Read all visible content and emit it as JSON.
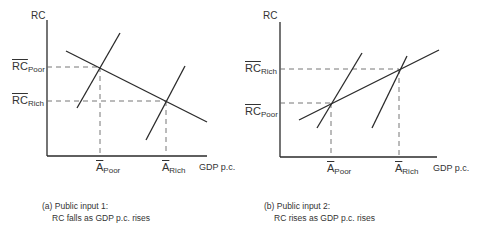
{
  "panels": [
    {
      "id": "a",
      "y_axis_label": "RC",
      "x_axis_label": "GDP p.c.",
      "y_ticks": [
        {
          "base": "RC",
          "sub": "Poor"
        },
        {
          "base": "RC",
          "sub": "Rich"
        }
      ],
      "x_ticks": [
        {
          "base": "A",
          "sub": "Poor"
        },
        {
          "base": "A",
          "sub": "Rich"
        }
      ],
      "caption_line1": "(a) Public input 1:",
      "caption_line2": "RC falls as GDP p.c. rises"
    },
    {
      "id": "b",
      "y_axis_label": "RC",
      "x_axis_label": "GDP p.c.",
      "y_ticks": [
        {
          "base": "RC",
          "sub": "Rich"
        },
        {
          "base": "RC",
          "sub": "Poor"
        }
      ],
      "x_ticks": [
        {
          "base": "A",
          "sub": "Poor"
        },
        {
          "base": "A",
          "sub": "Rich"
        }
      ],
      "caption_line1": "(b) Public input 2:",
      "caption_line2": "RC rises as GDP p.c. rises"
    }
  ],
  "colors": {
    "line": "#2a2a2a",
    "dashed": "#555555"
  }
}
